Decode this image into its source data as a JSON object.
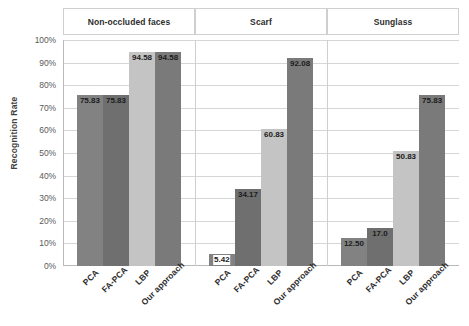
{
  "chart_data": {
    "type": "bar",
    "title": "",
    "xlabel": "",
    "ylabel": "Recognition Rate",
    "ylim": [
      0,
      100
    ],
    "ytick_labels": [
      "100%",
      "90%",
      "80%",
      "70%",
      "60%",
      "50%",
      "40%",
      "30%",
      "20%",
      "10%",
      "0%"
    ],
    "ytick_values": [
      100,
      90,
      80,
      70,
      60,
      50,
      40,
      30,
      20,
      10,
      0
    ],
    "grid": true,
    "legend": "none",
    "categories": [
      "PCA",
      "FA-PCA",
      "LBP",
      "Our approach"
    ],
    "panels": [
      {
        "title": "Non-occluded faces",
        "values": [
          75.83,
          75.83,
          94.58,
          94.58
        ],
        "labels": [
          "75.83",
          "75.83",
          "94.58",
          "94.58"
        ]
      },
      {
        "title": "Scarf",
        "values": [
          5.42,
          34.17,
          60.83,
          92.08
        ],
        "labels": [
          "5.42",
          "34.17",
          "60.83",
          "92.08"
        ]
      },
      {
        "title": "Sunglass",
        "values": [
          12.5,
          17.0,
          50.83,
          75.83
        ],
        "labels": [
          "12.50",
          "17.0",
          "50.83",
          "75.83"
        ]
      }
    ],
    "series_colors": [
      "#828282",
      "#6f6f6f",
      "#c4c4c4",
      "#7a7a7a"
    ]
  }
}
